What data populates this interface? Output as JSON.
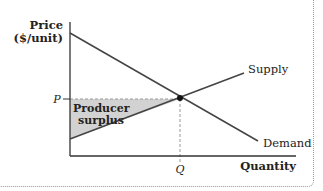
{
  "diagram": {
    "type": "supply-demand",
    "y_axis_label_line1": "Price",
    "y_axis_label_line2": "($/unit)",
    "x_axis_label": "Quantity",
    "price_tick": "P",
    "quantity_tick": "Q",
    "supply_label": "Supply",
    "demand_label": "Demand",
    "region_label_line1": "Producer",
    "region_label_line2": "surplus",
    "colors": {
      "line": "#444444",
      "axis": "#333333",
      "surplus_fill": "#cccccc",
      "dashed": "#999999",
      "point": "#111111"
    }
  }
}
